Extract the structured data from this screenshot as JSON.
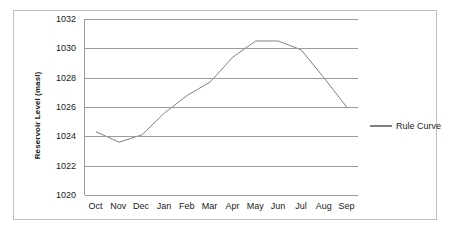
{
  "chart_data": {
    "type": "line",
    "title": "",
    "xlabel": "",
    "ylabel": "Reservoir Level (masl)",
    "categories": [
      "Oct",
      "Nov",
      "Dec",
      "Jan",
      "Feb",
      "Mar",
      "Apr",
      "May",
      "Jun",
      "Jul",
      "Aug",
      "Sep"
    ],
    "series": [
      {
        "name": "Rule Curve",
        "color": "#808080",
        "values": [
          1024.3,
          1023.6,
          1024.1,
          1025.6,
          1026.8,
          1027.7,
          1029.4,
          1030.5,
          1030.5,
          1029.9,
          1028.0,
          1026.0
        ]
      }
    ],
    "ylim": [
      1020,
      1032
    ],
    "yticks": [
      1020,
      1022,
      1024,
      1026,
      1028,
      1030,
      1032
    ],
    "ytick_labels": [
      "1020",
      "1022",
      "1024",
      "1026",
      "1028",
      "1030",
      "1032"
    ],
    "grid": true,
    "legend_position": "right",
    "gridline_color": "#9b9b9b",
    "border_color": "#bfbfbf"
  },
  "legend": {
    "entries": [
      {
        "label": "Rule Curve"
      }
    ]
  }
}
